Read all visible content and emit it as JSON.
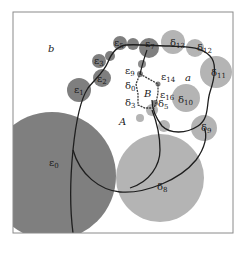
{
  "diagram": {
    "colors": {
      "epsilon_disk": "#7f7f7f",
      "delta_disk": "#b4b4b4",
      "curve": "#1e1e1e",
      "frame": "#8a8a8a",
      "background": "#ffffff"
    },
    "region_labels": {
      "b": "b",
      "a": "a",
      "A": "A",
      "B": "B"
    },
    "epsilon_labels": {
      "e0": "ε",
      "e0_sub": "0",
      "e1": "ε",
      "e1_sub": "1",
      "e2": "ε",
      "e2_sub": "2",
      "e3": "ε",
      "e3_sub": "3",
      "e5": "ε",
      "e5_sub": "5",
      "e7": "ε",
      "e7_sub": "7",
      "e9": "ε",
      "e9_sub": "9",
      "e14": "ε",
      "e14_sub": "14",
      "e16": "ε",
      "e16_sub": "16"
    },
    "delta_labels": {
      "d0": "δ",
      "d0_sub": "0",
      "d3": "δ",
      "d3_sub": "3",
      "d5": "δ",
      "d5_sub": "5",
      "d8": "δ",
      "d8_sub": "8",
      "d9": "δ",
      "d9_sub": "9",
      "d10": "δ",
      "d10_sub": "10",
      "d11": "δ",
      "d11_sub": "11",
      "d12": "δ",
      "d12_sub": "12",
      "d13": "δ",
      "d13_sub": "13"
    }
  }
}
